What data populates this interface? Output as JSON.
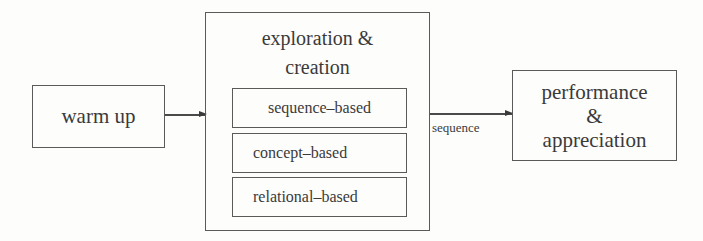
{
  "diagram": {
    "nodes": {
      "warm_up": {
        "label": "warm up"
      },
      "exploration": {
        "title_line1": "exploration &",
        "title_line2": "creation",
        "children": [
          {
            "label": "sequence–based"
          },
          {
            "label": "concept–based"
          },
          {
            "label": "relational–based"
          }
        ]
      },
      "performance": {
        "line1": "performance",
        "line2": "&",
        "line3": "appreciation"
      }
    },
    "edges": [
      {
        "from": "warm_up",
        "to": "exploration",
        "label": ""
      },
      {
        "from": "exploration",
        "to": "performance",
        "label": "sequence"
      }
    ]
  }
}
